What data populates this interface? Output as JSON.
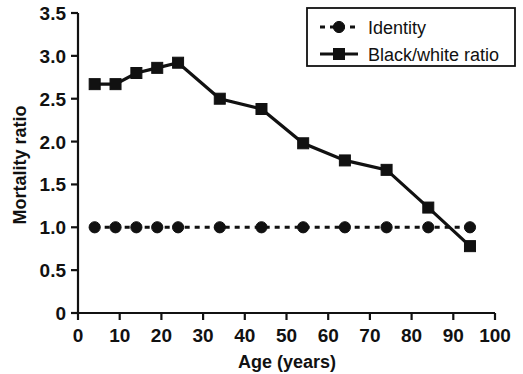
{
  "chart_data": {
    "type": "line",
    "title": "",
    "xlabel": "Age (years)",
    "ylabel": "Mortality ratio",
    "xlim": [
      0,
      100
    ],
    "ylim": [
      0,
      3.5
    ],
    "grid": false,
    "legend_position": "top-right",
    "x": [
      4,
      9,
      14,
      19,
      24,
      34,
      44,
      54,
      64,
      74,
      84,
      94
    ],
    "xticks": [
      0,
      10,
      20,
      30,
      40,
      50,
      60,
      70,
      80,
      90,
      100
    ],
    "xtick_labels": [
      "0",
      "10",
      "20",
      "30",
      "40",
      "50",
      "60",
      "70",
      "80",
      "90",
      "100"
    ],
    "yticks": [
      0,
      0.5,
      1.0,
      1.5,
      2.0,
      2.5,
      3.0,
      3.5
    ],
    "ytick_labels": [
      "0",
      "0.5",
      "1.0",
      "1.5",
      "2.0",
      "2.5",
      "3.0",
      "3.5"
    ],
    "series": [
      {
        "name": "Identity",
        "marker": "circle",
        "linestyle": "dotted",
        "color": "#111111",
        "values": [
          1.0,
          1.0,
          1.0,
          1.0,
          1.0,
          1.0,
          1.0,
          1.0,
          1.0,
          1.0,
          1.0,
          1.0
        ]
      },
      {
        "name": "Black/white ratio",
        "marker": "square",
        "linestyle": "solid",
        "color": "#111111",
        "values": [
          2.67,
          2.67,
          2.8,
          2.86,
          2.92,
          2.5,
          2.38,
          1.98,
          1.78,
          1.67,
          1.23,
          0.78
        ]
      }
    ]
  },
  "axes": {
    "y_title": "Mortality ratio",
    "x_title": "Age (years)"
  },
  "legend": {
    "items": [
      {
        "label": "Identity"
      },
      {
        "label": "Black/white ratio"
      }
    ]
  }
}
